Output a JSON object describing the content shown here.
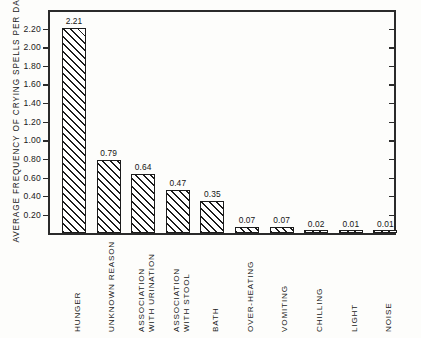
{
  "figure": {
    "background_color": "#fdfdfb",
    "ink_color": "#1c1c1c"
  },
  "chart_data": {
    "type": "bar",
    "title": "",
    "xlabel": "",
    "ylabel": "AVERAGE FREQUENCY OF CRYING SPELLS PER DAY",
    "ylim": [
      0,
      2.4
    ],
    "ytick_values": [
      0.2,
      0.4,
      0.6,
      0.8,
      1.0,
      1.2,
      1.4,
      1.6,
      1.8,
      2.0,
      2.2
    ],
    "ytick_labels": [
      "0.20",
      "0.40",
      "0.60",
      "0.80",
      "1.00",
      "1.20",
      "1.40",
      "1.60",
      "1.80",
      "2.00",
      "2.20"
    ],
    "grid": false,
    "legend": "none",
    "bar_style": "white fill with forward diagonal hatching, black outline",
    "categories": [
      "HUNGER",
      "UNKNOWN REASON",
      "ASSOCIATION WITH URINATION",
      "ASSOCIATION WITH STOOL",
      "BATH",
      "OVER-HEATING",
      "VOMITING",
      "CHILLING",
      "LIGHT",
      "NOISE"
    ],
    "category_lines": [
      [
        "HUNGER"
      ],
      [
        "UNKNOWN REASON"
      ],
      [
        "ASSOCIATION",
        "WITH URINATION"
      ],
      [
        "ASSOCIATION",
        "WITH STOOL"
      ],
      [
        "BATH"
      ],
      [
        "OVER-HEATING"
      ],
      [
        "VOMITING"
      ],
      [
        "CHILLING"
      ],
      [
        "LIGHT"
      ],
      [
        "NOISE"
      ]
    ],
    "values": [
      2.21,
      0.79,
      0.64,
      0.47,
      0.35,
      0.07,
      0.07,
      0.02,
      0.01,
      0.01
    ],
    "value_labels": [
      "2.21",
      "0.79",
      "0.64",
      "0.47",
      "0.35",
      "0.07",
      "0.07",
      "0.02",
      "0.01",
      "0.01"
    ]
  }
}
